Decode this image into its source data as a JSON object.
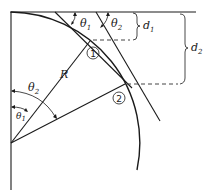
{
  "diagram": {
    "labels": {
      "radius": "R",
      "theta1_top": "θ",
      "theta1_top_sub": "1",
      "theta2_top": "θ",
      "theta2_top_sub": "2",
      "theta2_left": "θ",
      "theta2_left_sub": "2",
      "theta1_left": "θ",
      "theta1_left_sub": "1",
      "d1": "d",
      "d1_sub": "1",
      "d2": "d",
      "d2_sub": "2",
      "point1": "1",
      "point2": "2"
    },
    "colors": {
      "ink": "#1a1a1a",
      "background": "#ffffff"
    }
  }
}
